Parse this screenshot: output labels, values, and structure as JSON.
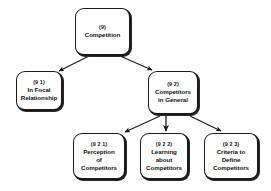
{
  "diagram": {
    "background_color": "#ffffff",
    "line_color": "#1a1a1a",
    "text_color": "#111111",
    "nodes": [
      {
        "id": "root",
        "code": "(9)",
        "lines": [
          "Competition"
        ]
      },
      {
        "id": "focal",
        "code": "(9 1)",
        "lines": [
          "In Focal",
          "Relationship"
        ]
      },
      {
        "id": "general",
        "code": "(9 2)",
        "lines": [
          "Competitors",
          "in General"
        ]
      },
      {
        "id": "perception",
        "code": "(9 2 1)",
        "lines": [
          "Perception",
          "of",
          "Competitors"
        ]
      },
      {
        "id": "learning",
        "code": "(9 2 2)",
        "lines": [
          "Learning",
          "about",
          "Competitors"
        ]
      },
      {
        "id": "criteria",
        "code": "(9 2 3)",
        "lines": [
          "Criteria to",
          "Define",
          "Competitors"
        ]
      }
    ],
    "edges": [
      {
        "from": "root",
        "to": "focal",
        "style": "arrow"
      },
      {
        "from": "root",
        "to": "general",
        "style": "arrow"
      },
      {
        "from": "general",
        "to": "perception",
        "style": "arrow"
      },
      {
        "from": "general",
        "to": "learning",
        "style": "arrow"
      },
      {
        "from": "general",
        "to": "criteria",
        "style": "arrow"
      }
    ]
  }
}
